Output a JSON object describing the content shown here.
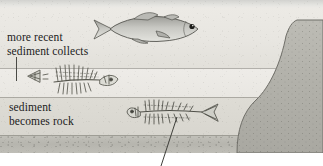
{
  "figure": {
    "width": 323,
    "height": 166
  },
  "labels": {
    "recent_sediment": "more recent\nsediment collects",
    "recent_sediment_line1": "more recent",
    "recent_sediment_line2": "sediment collects",
    "sediment_rock_line1": "sediment",
    "sediment_rock_line2": "becomes rock"
  },
  "elements": {
    "live_fish": "live-fish",
    "upper_skeleton": "fish-skeleton-upper",
    "lower_skeleton": "fish-skeleton-lower",
    "bedrock_mass": "bedrock-outcrop",
    "leader_vertical": "leader-line-vertical",
    "leader_diagonal": "leader-line-diagonal"
  },
  "colors": {
    "water_band": "#e4e4e0",
    "upper_sediment": "#eae8e3",
    "mid_sediment": "#edebe7",
    "lower_sediment": "#dbd9d2",
    "bottom_rock": "#bab9b2",
    "bedrock": "#b4b3ac",
    "ink": "#1b1b1b",
    "leader": "#4a4a46",
    "page": "#ffffff"
  },
  "layer_bounds": {
    "water_top": 0,
    "upper_top": 8,
    "mid_top": 68,
    "lower_top": 97,
    "bottom_top": 135,
    "scene_bottom": 153
  }
}
